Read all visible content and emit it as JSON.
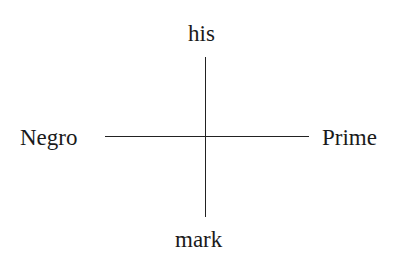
{
  "diagram": {
    "type": "cross",
    "labels": {
      "top": "his",
      "left": "Negro",
      "right": "Prime",
      "bottom": "mark"
    },
    "line_color": "#222222",
    "background": "#ffffff"
  }
}
